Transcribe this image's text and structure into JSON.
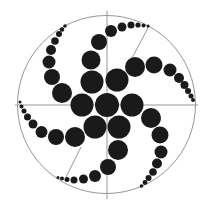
{
  "diagram": {
    "width": 207,
    "height": 210,
    "background": "#ffffff",
    "line_color": "#8a8a8a",
    "dot_color": "#1a1a1a",
    "outer_circle": {
      "cx": 106.5,
      "cy": 104.5,
      "r": 89
    },
    "lines": [
      {
        "name": "horizontal-axis",
        "x1": 15,
        "y1": 105,
        "x2": 198,
        "y2": 105
      },
      {
        "name": "vertical-axis",
        "x1": 107,
        "y1": 11,
        "x2": 107,
        "y2": 199
      },
      {
        "name": "diagonal-top-right",
        "x1": 149,
        "y1": 26,
        "x2": 131,
        "y2": 60
      },
      {
        "name": "diagonal-bottom-left",
        "x1": 66,
        "y1": 177,
        "x2": 81,
        "y2": 147
      }
    ],
    "dots": [
      {
        "group": "center",
        "cx": 107,
        "cy": 105,
        "r": 12
      },
      {
        "group": "ring",
        "cx": 82,
        "cy": 105,
        "r": 11.5
      },
      {
        "group": "ring",
        "cx": 132,
        "cy": 105,
        "r": 11.5
      },
      {
        "group": "ring",
        "cx": 117,
        "cy": 80,
        "r": 11.5
      },
      {
        "group": "ring",
        "cx": 92,
        "cy": 82,
        "r": 11.5
      },
      {
        "group": "ring",
        "cx": 95,
        "cy": 127,
        "r": 11.5
      },
      {
        "group": "ring",
        "cx": 119,
        "cy": 127,
        "r": 11.5
      },
      {
        "group": "arm-top",
        "cx": 91,
        "cy": 60,
        "r": 9.5
      },
      {
        "group": "arm-top",
        "cx": 99,
        "cy": 42,
        "r": 8
      },
      {
        "group": "arm-top",
        "cx": 111,
        "cy": 31,
        "r": 6
      },
      {
        "group": "arm-top",
        "cx": 122,
        "cy": 27,
        "r": 4.5
      },
      {
        "group": "arm-top",
        "cx": 131,
        "cy": 25,
        "r": 3.5
      },
      {
        "group": "arm-top",
        "cx": 138,
        "cy": 25,
        "r": 2.6
      },
      {
        "group": "arm-top",
        "cx": 143.5,
        "cy": 25.5,
        "r": 2
      },
      {
        "group": "arm-top",
        "cx": 148,
        "cy": 26,
        "r": 1.5
      },
      {
        "group": "arm-right",
        "cx": 135,
        "cy": 67,
        "r": 10
      },
      {
        "group": "arm-right",
        "cx": 154,
        "cy": 65,
        "r": 8.5
      },
      {
        "group": "arm-right",
        "cx": 170,
        "cy": 70,
        "r": 6.5
      },
      {
        "group": "arm-right",
        "cx": 179,
        "cy": 78,
        "r": 5
      },
      {
        "group": "arm-right",
        "cx": 184.5,
        "cy": 85,
        "r": 4
      },
      {
        "group": "arm-right",
        "cx": 188,
        "cy": 91,
        "r": 3
      },
      {
        "group": "arm-right",
        "cx": 191,
        "cy": 96,
        "r": 2.5
      },
      {
        "group": "arm-right",
        "cx": 193,
        "cy": 100,
        "r": 2
      },
      {
        "group": "arm-lower-right",
        "cx": 151,
        "cy": 118,
        "r": 10
      },
      {
        "group": "arm-lower-right",
        "cx": 160,
        "cy": 135,
        "r": 8.5
      },
      {
        "group": "arm-lower-right",
        "cx": 161,
        "cy": 152,
        "r": 6.5
      },
      {
        "group": "arm-lower-right",
        "cx": 157,
        "cy": 163.5,
        "r": 5
      },
      {
        "group": "arm-lower-right",
        "cx": 153,
        "cy": 172,
        "r": 3.8
      },
      {
        "group": "arm-lower-right",
        "cx": 148.5,
        "cy": 178,
        "r": 3
      },
      {
        "group": "arm-lower-right",
        "cx": 145,
        "cy": 182.5,
        "r": 2.4
      },
      {
        "group": "arm-lower-right",
        "cx": 141.5,
        "cy": 186,
        "r": 1.8
      },
      {
        "group": "arm-bottom",
        "cx": 118,
        "cy": 150,
        "r": 10
      },
      {
        "group": "arm-bottom",
        "cx": 108,
        "cy": 167,
        "r": 8
      },
      {
        "group": "arm-bottom",
        "cx": 95,
        "cy": 176,
        "r": 6
      },
      {
        "group": "arm-bottom",
        "cx": 83.5,
        "cy": 179,
        "r": 4.5
      },
      {
        "group": "arm-bottom",
        "cx": 74,
        "cy": 180,
        "r": 3.5
      },
      {
        "group": "arm-bottom",
        "cx": 67,
        "cy": 179.5,
        "r": 2.5
      },
      {
        "group": "arm-bottom",
        "cx": 62,
        "cy": 178.5,
        "r": 2
      },
      {
        "group": "arm-bottom",
        "cx": 58,
        "cy": 177.5,
        "r": 1.5
      },
      {
        "group": "arm-left",
        "cx": 75,
        "cy": 137,
        "r": 10
      },
      {
        "group": "arm-left",
        "cx": 56,
        "cy": 137,
        "r": 8
      },
      {
        "group": "arm-left",
        "cx": 41.5,
        "cy": 132,
        "r": 6
      },
      {
        "group": "arm-left",
        "cx": 33,
        "cy": 124,
        "r": 4.5
      },
      {
        "group": "arm-left",
        "cx": 27.5,
        "cy": 117,
        "r": 3.5
      },
      {
        "group": "arm-left",
        "cx": 24,
        "cy": 111,
        "r": 2.5
      },
      {
        "group": "arm-left",
        "cx": 21.5,
        "cy": 106.5,
        "r": 2
      },
      {
        "group": "arm-left",
        "cx": 20,
        "cy": 102,
        "r": 1.5
      },
      {
        "group": "arm-upper-left",
        "cx": 62,
        "cy": 93,
        "r": 10
      },
      {
        "group": "arm-upper-left",
        "cx": 52,
        "cy": 77,
        "r": 8
      },
      {
        "group": "arm-upper-left",
        "cx": 49,
        "cy": 62,
        "r": 6.5
      },
      {
        "group": "arm-upper-left",
        "cx": 51,
        "cy": 50,
        "r": 5
      },
      {
        "group": "arm-upper-left",
        "cx": 55,
        "cy": 41,
        "r": 3.8
      },
      {
        "group": "arm-upper-left",
        "cx": 59,
        "cy": 34,
        "r": 3
      },
      {
        "group": "arm-upper-left",
        "cx": 62,
        "cy": 29.5,
        "r": 2.3
      },
      {
        "group": "arm-upper-left",
        "cx": 65,
        "cy": 26,
        "r": 1.8
      }
    ]
  }
}
